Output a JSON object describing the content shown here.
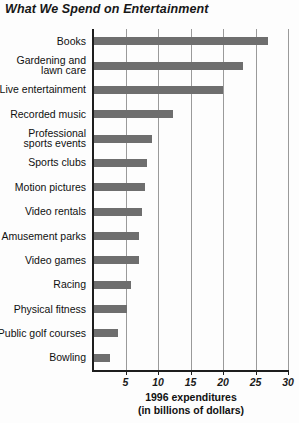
{
  "chart_data": {
    "type": "bar",
    "orientation": "horizontal",
    "title": "What We Spend on Entertainment",
    "xlabel_line1": "1996 expenditures",
    "xlabel_line2": "(in billions of dollars)",
    "ylabel": "",
    "xlim": [
      0,
      30
    ],
    "xticks": [
      5,
      10,
      15,
      20,
      25,
      30
    ],
    "grid": "vertical",
    "legend": "none",
    "bar_color": "#6e6e6e",
    "categories": [
      "Books",
      "Gardening and\nlawn care",
      "Live entertainment",
      "Recorded music",
      "Professional\nsports events",
      "Sports clubs",
      "Motion pictures",
      "Video rentals",
      "Amusement parks",
      "Video games",
      "Racing",
      "Physical fitness",
      "Public golf courses",
      "Bowling"
    ],
    "values": [
      26.9,
      23.1,
      20.0,
      12.3,
      9.1,
      8.3,
      8.0,
      7.5,
      7.1,
      7.1,
      5.8,
      5.2,
      3.8,
      2.6
    ]
  }
}
